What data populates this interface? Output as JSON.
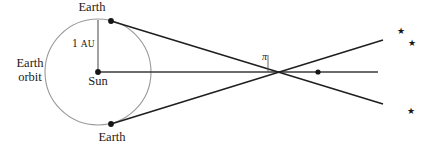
{
  "figure": {
    "type": "astronomy-parallax-diagram",
    "background_color": "#ffffff"
  },
  "labels": {
    "earth_top": "Earth",
    "earth_bottom": "Earth",
    "earth_orbit_line1": "Earth",
    "earth_orbit_line2": "orbit",
    "one_au_value": "1",
    "one_au_unit": "AU",
    "sun": "Sun",
    "parallax_angle": "π"
  },
  "stars": [
    {
      "name": "star-upper-1",
      "glyph": "★",
      "x": 397,
      "y": 27
    },
    {
      "name": "star-upper-2",
      "glyph": "★",
      "x": 408,
      "y": 39
    },
    {
      "name": "star-lower-1",
      "glyph": "★",
      "x": 407,
      "y": 107
    }
  ],
  "colors": {
    "orbit_stroke": "#9a9a9a",
    "sightline_stroke": "#1f1f1f",
    "baseline_stroke": "#3a3a3a",
    "angle_tick_stroke": "#555555",
    "point_fill": "#161616",
    "text": "#1a1a1a"
  },
  "geometry": {
    "orbit_center": {
      "x": 98,
      "y": 72
    },
    "orbit_radius": 53,
    "sun_point": {
      "x": 98,
      "y": 72
    },
    "earth_top_point": {
      "x": 111,
      "y": 21
    },
    "earth_bottom_point": {
      "x": 111,
      "y": 124
    },
    "convergence_point": {
      "x": 318,
      "y": 72
    },
    "baseline_end_x": 378,
    "sightline_top_extend": {
      "x": 383,
      "y": 40
    },
    "sightline_bottom_extend": {
      "x": 383,
      "y": 104
    },
    "au_line_top": {
      "x": 98,
      "y": 20
    },
    "angle_tick_x": 268,
    "angle_tick_top_y": 55,
    "angle_tick_bottom_y": 72
  }
}
